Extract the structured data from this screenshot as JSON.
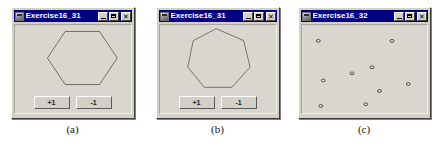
{
  "figures": [
    {
      "caption": "(a)",
      "window": {
        "title": "Exercise16_31",
        "icon": "java-coffee-icon",
        "controls": {
          "minimize": "_",
          "maximize": "□",
          "close": "✕"
        }
      },
      "shape": {
        "kind": "polygon",
        "name": "hexagon",
        "sides": 6
      },
      "buttons": [
        {
          "label": "+1",
          "name": "increase-sides-button"
        },
        {
          "label": "-1",
          "name": "decrease-sides-button"
        }
      ]
    },
    {
      "caption": "(b)",
      "window": {
        "title": "Exercise16_31",
        "icon": "java-coffee-icon",
        "controls": {
          "minimize": "_",
          "maximize": "□",
          "close": "✕"
        }
      },
      "shape": {
        "kind": "polygon",
        "name": "heptagon",
        "sides": 7
      },
      "buttons": [
        {
          "label": "+1",
          "name": "increase-sides-button"
        },
        {
          "label": "-1",
          "name": "decrease-sides-button"
        }
      ]
    },
    {
      "caption": "(c)",
      "window": {
        "title": "Exercise16_32",
        "icon": "java-coffee-icon",
        "controls": {
          "minimize": "_",
          "maximize": "□",
          "close": "✕"
        }
      },
      "shape": {
        "kind": "scatter-points",
        "name": "random-points",
        "count": 9
      },
      "buttons": []
    }
  ],
  "chart_data": {
    "type": "scatter",
    "title": "Exercise16_32",
    "xlabel": "",
    "ylabel": "",
    "xlim": [
      0,
      100
    ],
    "ylim": [
      0,
      100
    ],
    "grid": false,
    "legend": "none",
    "series": [
      {
        "name": "random points",
        "points": [
          [
            13,
            82
          ],
          [
            72,
            82
          ],
          [
            56,
            52
          ],
          [
            40,
            45
          ],
          [
            17,
            37
          ],
          [
            85,
            33
          ],
          [
            62,
            25
          ],
          [
            51,
            10
          ],
          [
            15,
            8
          ]
        ]
      }
    ]
  },
  "colors": {
    "titlebar": "#000080",
    "titlebar_text": "#ffffff",
    "window_face": "#d4d0c8",
    "client_bg": "#d9d6cf",
    "shape_stroke": "#6b6b6b",
    "point_stroke": "#555555",
    "page_bg": "#ffffff"
  },
  "geometry": {
    "hexagon_points": "51,6 86,6 104,33 86,60 51,60 33,33",
    "heptagon_points": "57,4 87,17 94,46 74,68 44,68 26,46 32,17"
  }
}
